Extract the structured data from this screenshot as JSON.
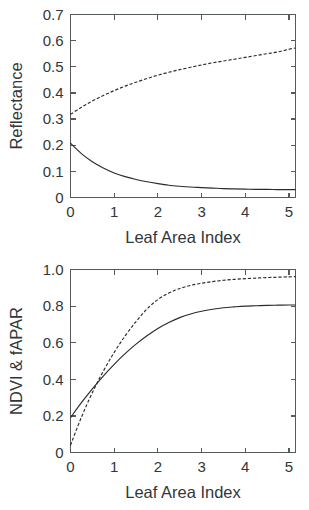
{
  "figure": {
    "background": "#ffffff",
    "line_color": "#2b2b2b",
    "axis_color": "#555a5c"
  },
  "chart_data": [
    {
      "type": "line",
      "title": "",
      "panel": "top",
      "xlabel": "Leaf Area Index",
      "ylabel": "Reflectance",
      "xlim": [
        0,
        5.15
      ],
      "ylim": [
        0,
        0.7
      ],
      "xticks": [
        0,
        1,
        2,
        3,
        4,
        5
      ],
      "xticklabels": [
        "0",
        "1",
        "2",
        "3",
        "4",
        "5"
      ],
      "yticks": [
        0,
        0.1,
        0.2,
        0.3,
        0.4,
        0.5,
        0.6,
        0.7
      ],
      "yticklabels": [
        "0",
        "0.1",
        "0.2",
        "0.3",
        "0.4",
        "0.5",
        "0.6",
        "0.7"
      ],
      "grid": false,
      "legend": null,
      "series": [
        {
          "name": "NIR reflectance",
          "style": "dashed",
          "x": [
            0,
            0.25,
            0.5,
            0.75,
            1,
            1.25,
            1.5,
            1.75,
            2,
            2.25,
            2.5,
            2.75,
            3,
            3.25,
            3.5,
            3.75,
            4,
            4.25,
            4.5,
            4.75,
            5,
            5.15
          ],
          "values": [
            0.318,
            0.345,
            0.369,
            0.39,
            0.409,
            0.426,
            0.441,
            0.455,
            0.468,
            0.479,
            0.489,
            0.498,
            0.507,
            0.515,
            0.522,
            0.529,
            0.536,
            0.543,
            0.55,
            0.557,
            0.567,
            0.572
          ]
        },
        {
          "name": "Red reflectance",
          "style": "solid",
          "x": [
            0,
            0.25,
            0.5,
            0.75,
            1,
            1.25,
            1.5,
            1.75,
            2,
            2.25,
            2.5,
            2.75,
            3,
            3.25,
            3.5,
            3.75,
            4,
            4.25,
            4.5,
            4.75,
            5,
            5.15
          ],
          "values": [
            0.208,
            0.168,
            0.137,
            0.113,
            0.094,
            0.08,
            0.069,
            0.06,
            0.053,
            0.047,
            0.043,
            0.04,
            0.038,
            0.036,
            0.034,
            0.033,
            0.032,
            0.031,
            0.031,
            0.03,
            0.03,
            0.03
          ]
        }
      ]
    },
    {
      "type": "line",
      "title": "",
      "panel": "bottom",
      "xlabel": "Leaf Area Index",
      "ylabel": "NDVI & fAPAR",
      "xlim": [
        0,
        5.15
      ],
      "ylim": [
        0,
        1.0
      ],
      "xticks": [
        0,
        1,
        2,
        3,
        4,
        5
      ],
      "xticklabels": [
        "0",
        "1",
        "2",
        "3",
        "4",
        "5"
      ],
      "yticks": [
        0,
        0.2,
        0.4,
        0.6,
        0.8,
        1.0
      ],
      "yticklabels": [
        "0",
        "0.2",
        "0.4",
        "0.6",
        "0.8",
        "1.0"
      ],
      "grid": false,
      "legend": null,
      "series": [
        {
          "name": "fAPAR",
          "style": "dashed",
          "x": [
            0,
            0.25,
            0.5,
            0.75,
            1,
            1.25,
            1.5,
            1.75,
            2,
            2.25,
            2.5,
            2.75,
            3,
            3.25,
            3.5,
            3.75,
            4,
            4.25,
            4.5,
            4.75,
            5,
            5.15
          ],
          "values": [
            0.04,
            0.193,
            0.327,
            0.444,
            0.547,
            0.637,
            0.715,
            0.784,
            0.836,
            0.871,
            0.896,
            0.913,
            0.925,
            0.934,
            0.941,
            0.946,
            0.95,
            0.953,
            0.956,
            0.958,
            0.96,
            0.961
          ]
        },
        {
          "name": "NDVI",
          "style": "solid",
          "x": [
            0,
            0.25,
            0.5,
            0.75,
            1,
            1.25,
            1.5,
            1.75,
            2,
            2.25,
            2.5,
            2.75,
            3,
            3.25,
            3.5,
            3.75,
            4,
            4.25,
            4.5,
            4.75,
            5,
            5.15
          ],
          "values": [
            0.19,
            0.272,
            0.348,
            0.418,
            0.482,
            0.54,
            0.592,
            0.638,
            0.678,
            0.71,
            0.737,
            0.757,
            0.772,
            0.783,
            0.791,
            0.796,
            0.8,
            0.802,
            0.804,
            0.805,
            0.806,
            0.806
          ]
        }
      ]
    }
  ]
}
